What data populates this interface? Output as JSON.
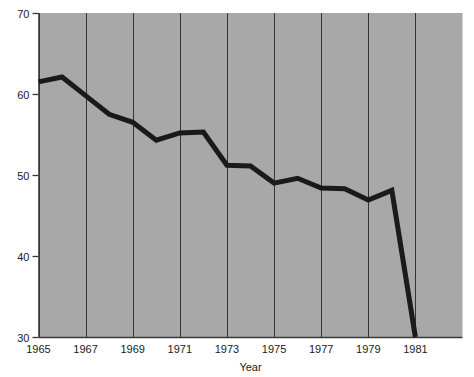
{
  "chart_data": {
    "type": "line",
    "title": "",
    "xlabel": "Year",
    "ylabel": "",
    "x": [
      1965,
      1966,
      1967,
      1968,
      1969,
      1970,
      1971,
      1972,
      1973,
      1974,
      1975,
      1976,
      1977,
      1978,
      1979,
      1980,
      1981
    ],
    "values": [
      61.5,
      62.1,
      59.8,
      57.5,
      56.5,
      54.3,
      55.2,
      55.3,
      51.2,
      51.1,
      49.0,
      49.6,
      48.4,
      48.3,
      46.9,
      48.1,
      30.0
    ],
    "series": [
      {
        "name": "",
        "values": [
          61.5,
          62.1,
          59.8,
          57.5,
          56.5,
          54.3,
          55.2,
          55.3,
          51.2,
          51.1,
          49.0,
          49.6,
          48.4,
          48.3,
          46.9,
          48.1,
          30.0
        ]
      }
    ],
    "xlim": [
      1965,
      1983
    ],
    "ylim": [
      30,
      70
    ],
    "xticks": [
      1965,
      1967,
      1969,
      1971,
      1973,
      1975,
      1977,
      1979,
      1981
    ],
    "xtick_labels": [
      "1965",
      "1967",
      "1969",
      "1971",
      "1973",
      "1975",
      "1977",
      "1979",
      "1981"
    ],
    "yticks": [
      30,
      40,
      50,
      60,
      70
    ],
    "ytick_labels": [
      "30",
      "40",
      "50",
      "60",
      "70"
    ],
    "grid": {
      "vertical": true,
      "horizontal": false,
      "vertical_at": [
        1965,
        1967,
        1969,
        1971,
        1973,
        1975,
        1977,
        1979,
        1981
      ]
    },
    "legend": null,
    "annotations": [],
    "colors": {
      "plot_background": "#a8a8a8",
      "line": "#1a1a1a",
      "grid": "#333333",
      "axis": "#3a3a3a",
      "text": "#1a1a1a",
      "page_background": "#ffffff"
    },
    "line_width_px": 5
  }
}
